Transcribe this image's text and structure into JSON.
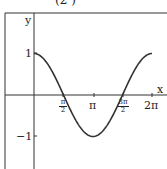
{
  "title_fragment": "(2    )",
  "chart_data": {
    "type": "line",
    "title": "",
    "xlabel": "x",
    "ylabel": "y",
    "function": "cos(x)",
    "x_ticks": [
      "π/2",
      "π",
      "3π/2",
      "2π"
    ],
    "y_ticks": [
      "1",
      "−1"
    ],
    "xlim": [
      0,
      6.2832
    ],
    "ylim": [
      -1,
      1
    ],
    "grid": false,
    "series": [
      {
        "name": "y = cos x",
        "x": [
          0,
          0.7854,
          1.5708,
          2.3562,
          3.1416,
          3.927,
          4.7124,
          5.4978,
          6.2832
        ],
        "y": [
          1,
          0.707,
          0,
          -0.707,
          -1,
          -0.707,
          0,
          0.707,
          1
        ]
      }
    ]
  },
  "labels": {
    "y_axis": "y",
    "x_axis": "x",
    "y_one": "1",
    "y_neg_one": "−1",
    "x_pi_half_num": "π",
    "x_pi_half_den": "2",
    "x_pi": "π",
    "x_three_pi_half_num": "3π",
    "x_three_pi_half_den": "2",
    "x_two_pi": "2π"
  }
}
